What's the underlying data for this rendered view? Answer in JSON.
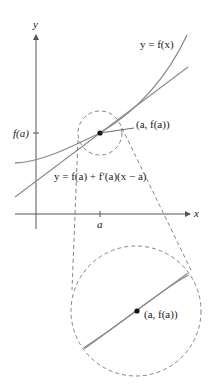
{
  "figure": {
    "axes": {
      "x_label": "x",
      "y_label": "y"
    },
    "labels": {
      "curve": "y = f(x)",
      "tangent": "y = f(a) + f′(a)(x − a)",
      "point": "(a, f(a))",
      "point_zoom": "(a, f(a))",
      "x_tick": "a",
      "y_tick": "f(a)"
    },
    "colors": {
      "curve": "#8a8a8a",
      "tangent": "#8a8a8a",
      "axes": "#555555",
      "dashed": "#777777",
      "point": "#111111"
    }
  }
}
